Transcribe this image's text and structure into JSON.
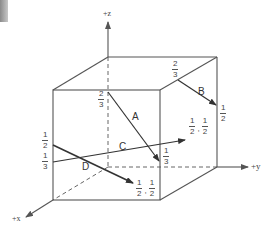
{
  "figure": {
    "axes": {
      "z": "+z",
      "y": "+y",
      "x": "+x"
    },
    "vectors": [
      {
        "name": "A",
        "start_label": "2/3",
        "end_label": "1/3"
      },
      {
        "name": "B",
        "start_label": "2/3",
        "end_label": "1/2"
      },
      {
        "name": "C",
        "start_label": "1/3",
        "end_label": "1/2, 1/2"
      },
      {
        "name": "D",
        "start_label": "1/2",
        "end_label": "1/2, 1/2"
      }
    ],
    "fractions": {
      "a_start": {
        "num": "2",
        "den": "3"
      },
      "a_end": {
        "num": "1",
        "den": "3"
      },
      "b_start": {
        "num": "2",
        "den": "3"
      },
      "b_end": {
        "num": "1",
        "den": "2"
      },
      "c_start": {
        "num": "1",
        "den": "3"
      },
      "c_end_1": {
        "num": "1",
        "den": "2"
      },
      "c_end_2": {
        "num": "1",
        "den": "2"
      },
      "d_start": {
        "num": "1",
        "den": "2"
      },
      "d_end_1": {
        "num": "1",
        "den": "2"
      },
      "d_end_2": {
        "num": "1",
        "den": "2"
      }
    },
    "separator": ",",
    "colors": {
      "edge": "#555555",
      "vector": "#333333"
    }
  }
}
